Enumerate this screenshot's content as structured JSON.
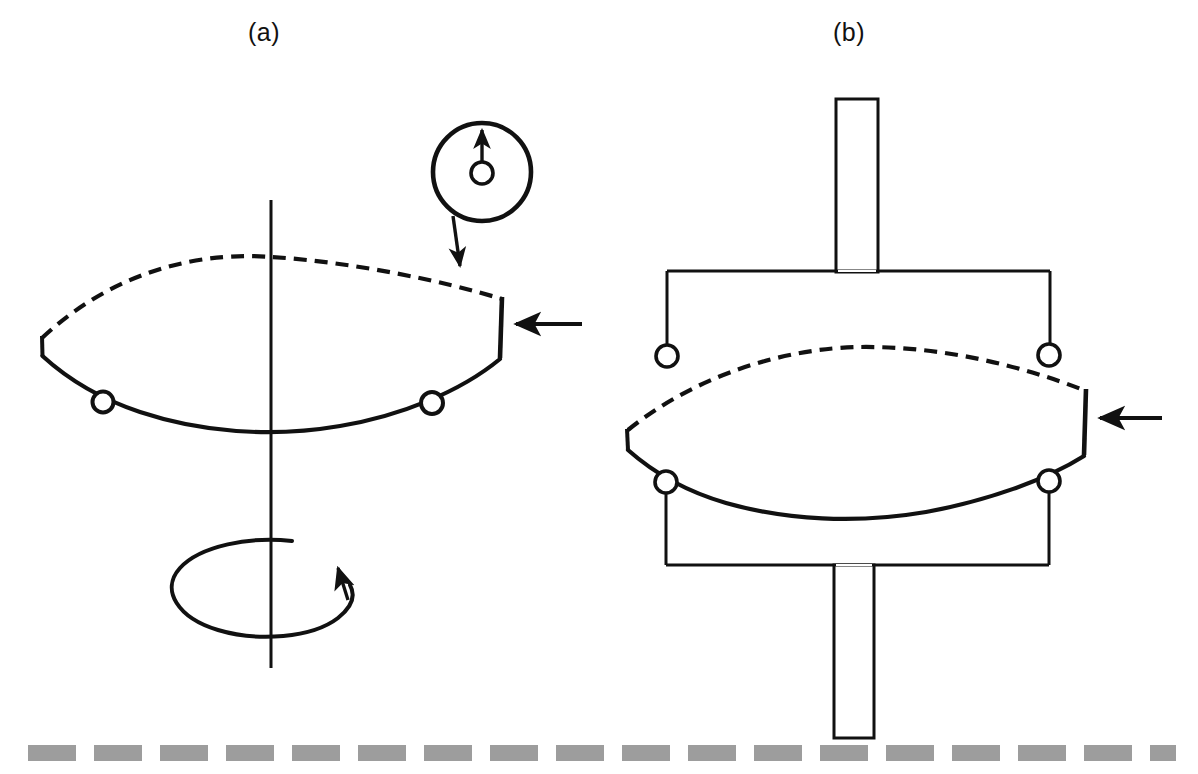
{
  "figure": {
    "background_color": "#ffffff",
    "stroke_color": "#111111",
    "ground_color": "#9d9d9d",
    "width": 1198,
    "height": 774,
    "panels": [
      {
        "id": "a",
        "label": "(a)",
        "label_x": 248,
        "label_y": 18,
        "description": "Free rotor on vertical spin axis with rotation direction arrow and magnified detail callout",
        "elements": {
          "spin_axis": {
            "name": "vertical-spin-axis",
            "x": 271,
            "y_top": 200,
            "y_bottom": 668
          },
          "rotor_lens": {
            "name": "rotor-lens-body",
            "left_vertex_x": 42,
            "left_vertex_y": 338,
            "right_vertex_x": 502,
            "right_vertex_y": 298,
            "top_edge_style": "dashed",
            "bottom_edge_style": "solid"
          },
          "rollers": [
            {
              "name": "roller-left",
              "cx": 103,
              "cy": 402,
              "r": 10
            },
            {
              "name": "roller-right",
              "cx": 432,
              "cy": 403,
              "r": 11
            }
          ],
          "load_arrow": {
            "name": "edge-load-arrow",
            "tip_x": 512,
            "tail_x": 582,
            "y": 324,
            "direction": "left"
          },
          "rotation_arrow": {
            "name": "rotation-direction-arrow",
            "cx": 270,
            "cy": 588,
            "rx": 82,
            "ry": 47,
            "direction": "counterclockwise-from-above"
          },
          "detail_callout": {
            "name": "magnified-detail-circle",
            "cx": 482,
            "cy": 172,
            "r": 49,
            "inner_circle": {
              "name": "detail-pin-circle",
              "cx": 482,
              "cy": 173,
              "r": 11
            },
            "inner_arrow": {
              "name": "detail-direction-arrow",
              "from_y": 162,
              "to_y": 124,
              "direction": "up"
            },
            "leader": {
              "name": "callout-leader-line",
              "from_x": 455,
              "from_y": 218,
              "to_x": 461,
              "to_y": 272
            }
          }
        }
      },
      {
        "id": "b",
        "label": "(b)",
        "label_x": 833,
        "label_y": 18,
        "description": "Rotor constrained by upper and lower support frames attached to a central shaft",
        "elements": {
          "upper_shaft": {
            "name": "upper-shaft",
            "x": 836,
            "y": 99,
            "width": 42,
            "height": 172
          },
          "lower_shaft": {
            "name": "lower-shaft",
            "x": 834,
            "y": 565,
            "width": 40,
            "height": 173
          },
          "upper_frame": {
            "name": "upper-support-frame",
            "bar_y": 271,
            "left_x": 667,
            "right_x": 1050,
            "drop_to_y": 345
          },
          "lower_frame": {
            "name": "lower-support-frame",
            "bar_y": 565,
            "left_x": 666,
            "right_x": 1049,
            "rise_from_y": 492
          },
          "rotor_lens": {
            "name": "rotor-lens-body",
            "left_vertex_x": 627,
            "left_vertex_y": 432,
            "right_vertex_x": 1086,
            "right_vertex_y": 390,
            "top_edge_style": "dashed",
            "bottom_edge_style": "solid"
          },
          "rollers": [
            {
              "name": "roller-upper-left",
              "cx": 667,
              "cy": 356,
              "r": 11
            },
            {
              "name": "roller-upper-right",
              "cx": 1049,
              "cy": 355,
              "r": 11
            },
            {
              "name": "roller-lower-left",
              "cx": 666,
              "cy": 482,
              "r": 11
            },
            {
              "name": "roller-lower-right",
              "cx": 1049,
              "cy": 481,
              "r": 11
            }
          ],
          "load_arrow": {
            "name": "edge-load-arrow",
            "tip_x": 1096,
            "tail_x": 1162,
            "y": 418,
            "direction": "left"
          }
        }
      }
    ],
    "ground": {
      "name": "ground-dashed-line",
      "y": 745,
      "height": 16,
      "dash_length": 48,
      "gap_length": 18,
      "start_x": 28,
      "end_x": 1176,
      "color": "#9d9d9d"
    }
  }
}
